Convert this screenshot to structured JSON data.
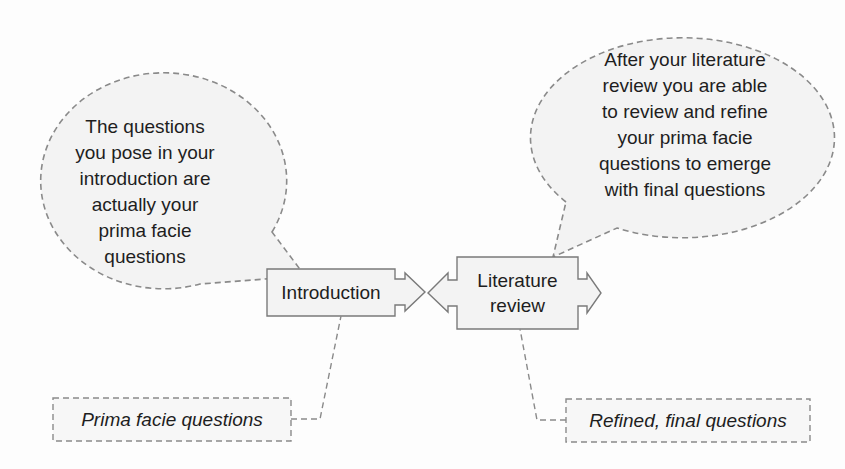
{
  "diagram": {
    "nodes": {
      "introduction": {
        "label": "Introduction"
      },
      "literature_review": {
        "label_line1": "Literature",
        "label_line2": "review"
      }
    },
    "bubbles": {
      "left": {
        "lines": [
          "The questions",
          "you pose in your",
          "introduction are",
          "actually your",
          "prima facie",
          "questions"
        ]
      },
      "right": {
        "lines": [
          "After your literature",
          "review you are able",
          "to review and refine",
          "your prima facie",
          "questions to emerge",
          "with final questions"
        ]
      }
    },
    "labels": {
      "left": "Prima facie questions",
      "right": "Refined, final questions"
    },
    "colors": {
      "stroke": "#7a7a7a",
      "dash_stroke": "#8a8a8a",
      "fill": "#f3f3f3",
      "text": "#1e1e1e"
    }
  }
}
